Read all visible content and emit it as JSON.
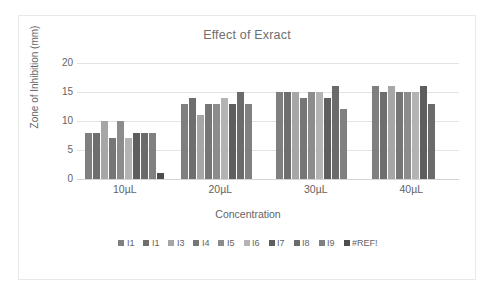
{
  "chart_data": {
    "type": "bar",
    "title": "Effect of Exract",
    "xlabel": "Concentration",
    "ylabel": "Zone of Inhibition (mm)",
    "categories": [
      "10µL",
      "20µL",
      "30µL",
      "40µL"
    ],
    "ylim": [
      0,
      20
    ],
    "yticks": [
      0,
      5,
      10,
      15,
      20
    ],
    "ytick_labels": [
      "0",
      "5",
      "10",
      "15",
      "20"
    ],
    "grid": true,
    "legend_position": "bottom",
    "series": [
      {
        "name": "I1",
        "color": "#7f7f7f",
        "values": [
          8,
          13,
          15,
          16
        ]
      },
      {
        "name": "I1",
        "color": "#6e6e6e",
        "values": [
          8,
          14,
          15,
          15
        ]
      },
      {
        "name": "I3",
        "color": "#a6a6a6",
        "values": [
          10,
          11,
          15,
          16
        ]
      },
      {
        "name": "I4",
        "color": "#767676",
        "values": [
          7,
          13,
          14,
          15
        ]
      },
      {
        "name": "I5",
        "color": "#8c8c8c",
        "values": [
          10,
          13,
          15,
          15
        ]
      },
      {
        "name": "I6",
        "color": "#b3b3b3",
        "values": [
          7,
          14,
          15,
          15
        ]
      },
      {
        "name": "I7",
        "color": "#5e5e5e",
        "values": [
          8,
          13,
          14,
          16
        ]
      },
      {
        "name": "I8",
        "color": "#6b6b6b",
        "values": [
          8,
          15,
          16,
          13
        ]
      },
      {
        "name": "I9",
        "color": "#808080",
        "values": [
          8,
          13,
          12,
          0
        ]
      },
      {
        "name": "#REF!",
        "color": "#4d4d4d",
        "values": [
          1,
          0,
          0,
          0
        ]
      }
    ]
  },
  "legend": {
    "items": [
      {
        "label": "I1",
        "color": "#7f7f7f"
      },
      {
        "label": "I1",
        "color": "#6e6e6e"
      },
      {
        "label": "I3",
        "color": "#a6a6a6"
      },
      {
        "label": "I4",
        "color": "#767676"
      },
      {
        "label": "I5",
        "color": "#8c8c8c"
      },
      {
        "label": "I6",
        "color": "#b3b3b3"
      },
      {
        "label": "I7",
        "color": "#5e5e5e"
      },
      {
        "label": "I8",
        "color": "#6b6b6b"
      },
      {
        "label": "I9",
        "color": "#808080"
      },
      {
        "label": "#REF!",
        "color": "#4d4d4d"
      }
    ]
  }
}
